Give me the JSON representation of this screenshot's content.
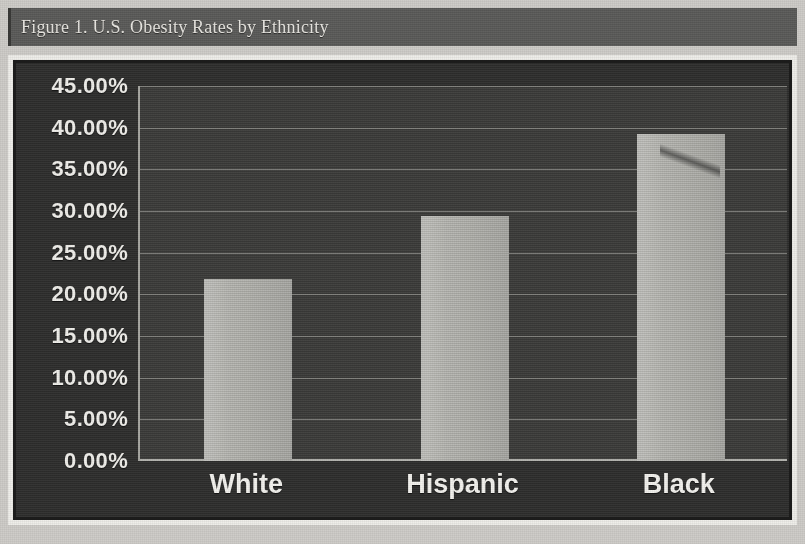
{
  "figure": {
    "caption": "Figure 1. U.S. Obesity Rates by Ethnicity"
  },
  "colors": {
    "title_bar_bg": "#5c5c5a",
    "title_text": "#e8e6e1",
    "chart_frame": "#efeeea",
    "chart_bg": "#2f2f2e",
    "plot_bg": "#3d3d3b",
    "bar_fill": "#b6b6b1",
    "gridline": "#8e8e89",
    "axis_text": "#f0efeb"
  },
  "chart_data": {
    "type": "bar",
    "title": "Figure 1. U.S. Obesity Rates by Ethnicity",
    "xlabel": "",
    "ylabel": "",
    "categories": [
      "White",
      "Hispanic",
      "Black"
    ],
    "values": [
      21.8,
      29.4,
      39.3
    ],
    "value_labels": [
      "21.80%",
      "29.40%",
      "39.30%"
    ],
    "ylim": [
      0,
      45
    ],
    "ytick_step": 5,
    "ytick_labels": [
      "45.00%",
      "40.00%",
      "35.00%",
      "30.00%",
      "25.00%",
      "20.00%",
      "15.00%",
      "10.00%",
      "5.00%",
      "0.00%"
    ],
    "ytick_values": [
      45,
      40,
      35,
      30,
      25,
      20,
      15,
      10,
      5,
      0
    ],
    "grid": true,
    "legend": false,
    "legend_position": "none",
    "series": [
      {
        "name": "Obesity rate",
        "values": [
          21.8,
          29.4,
          39.3
        ]
      }
    ]
  }
}
